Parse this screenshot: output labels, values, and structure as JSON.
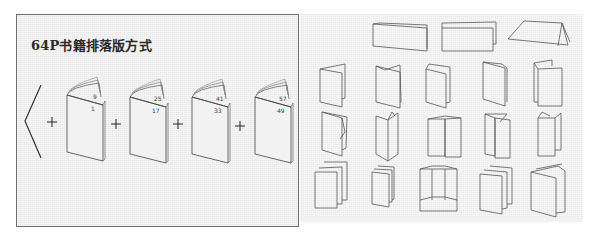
{
  "left_panel": {
    "title": "64P书籍排落版方式",
    "bracket": "<",
    "operator": "+",
    "signatures": [
      {
        "outer_page": "9",
        "inner_page": "1"
      },
      {
        "outer_page": "25",
        "inner_page": "17"
      },
      {
        "outer_page": "41",
        "inner_page": "33"
      },
      {
        "outer_page": "57",
        "inner_page": "49"
      }
    ]
  },
  "right_panel": {
    "description": "Folding style illustrations",
    "rows": [
      {
        "count": 3,
        "type": "horizontal-fold"
      },
      {
        "count": 5,
        "type": "vertical-fold"
      },
      {
        "count": 5,
        "type": "accordion-fold"
      },
      {
        "count": 5,
        "type": "multi-panel-fold"
      }
    ]
  },
  "colors": {
    "panel_bg": "#e9e9e9",
    "border": "#6e6e6e",
    "line": "#555555",
    "text": "#2a2a2a"
  }
}
